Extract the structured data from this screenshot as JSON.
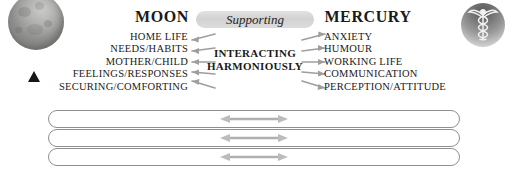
{
  "diagram": {
    "left_planet": {
      "icon": "moon-icon",
      "title": "MOON",
      "keywords": [
        "HOME LIFE",
        "NEEDS/HABITS",
        "MOTHER/CHILD",
        "FEELINGS/RESPONSES",
        "SECURING/COMFORTING"
      ]
    },
    "right_planet": {
      "icon": "caduceus-mercury-icon",
      "title": "MERCURY",
      "keywords": [
        "ANXIETY",
        "HUMOUR",
        "WORKING LIFE",
        "COMMUNICATION",
        "PERCEPTION/ATTITUDE"
      ]
    },
    "aspect_pill": {
      "label": "Supporting"
    },
    "center_label": {
      "line1": "INTERACTING",
      "line2": "HARMONIOUSLY"
    },
    "marker": {
      "name": "triangle-marker"
    },
    "bottom_rows": [
      {
        "text": ""
      },
      {
        "text": ""
      },
      {
        "text": ""
      }
    ],
    "colors": {
      "pill_background": "#d6d6d6",
      "row_border": "#8f8f8f",
      "arrow_gray": "#a8a8a8",
      "text": "#1a1a1a",
      "marker": "#161616"
    }
  }
}
